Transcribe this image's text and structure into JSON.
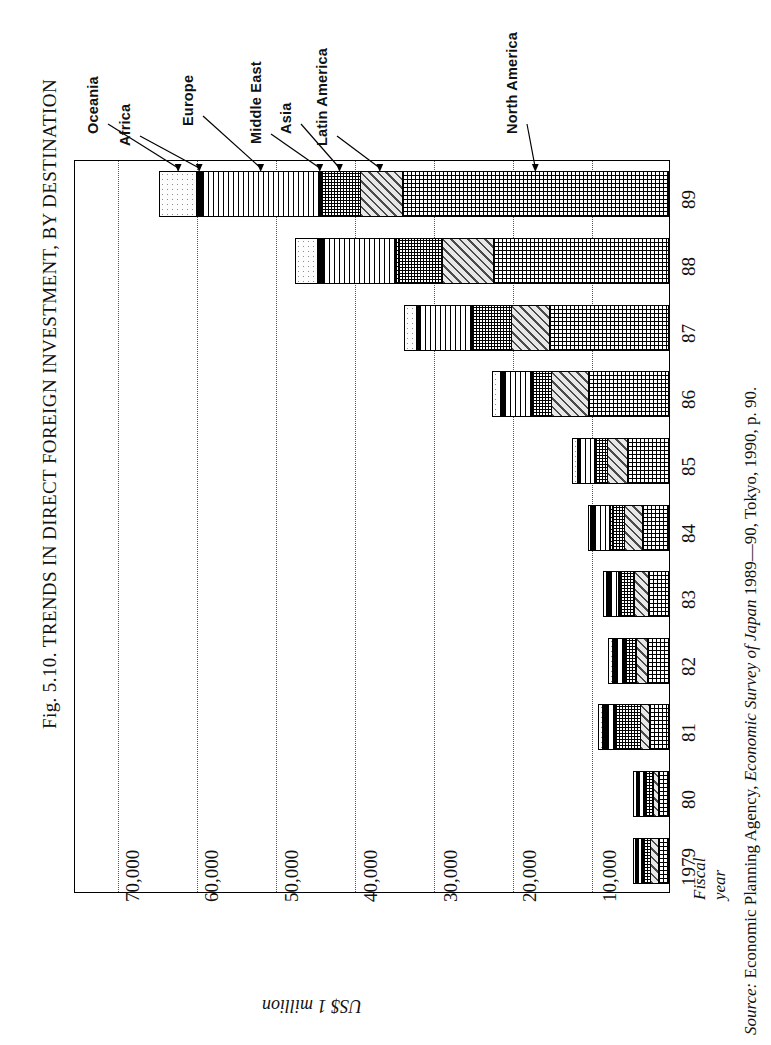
{
  "figure": {
    "title": "Fig. 5.10. TRENDS IN DIRECT FOREIGN INVESTMENT,  BY DESTINATION",
    "axis_unit": "US$ 1 million",
    "fiscal_label_line1": "Fiscal",
    "fiscal_label_line2": "year",
    "source_prefix": "Source:",
    "source_body_1": " Economic Planning Agency, ",
    "source_italic": "Economic Survey of Japan",
    "source_body_2": " 1989—90, Tokyo, 1990, p. 90."
  },
  "callouts": [
    {
      "label": "Oceania"
    },
    {
      "label": "Africa"
    },
    {
      "label": "Europe"
    },
    {
      "label": "Middle East"
    },
    {
      "label": "Asia"
    },
    {
      "label": "Latin America"
    },
    {
      "label": "North America"
    }
  ],
  "chart_data": {
    "type": "bar",
    "orientation": "horizontal-stacked",
    "title": "Fig. 5.10. TRENDS IN DIRECT FOREIGN INVESTMENT,  BY DESTINATION",
    "xlabel": "US$ 1 million",
    "ylabel": "Fiscal year",
    "grid": true,
    "legend_position": "callout-arrows-above-plot",
    "xlim": [
      0,
      75000
    ],
    "value_ticks": [
      "70,000",
      "60,000",
      "50,000",
      "40,000",
      "30,000",
      "20,000",
      "10,000"
    ],
    "value_tick_numbers": [
      70000,
      60000,
      50000,
      40000,
      30000,
      20000,
      10000
    ],
    "categories": [
      "1979",
      "80",
      "81",
      "82",
      "83",
      "84",
      "85",
      "86",
      "87",
      "88",
      "89"
    ],
    "series": [
      {
        "name": "North America",
        "pattern": "namerica",
        "values": [
          1438,
          1484,
          2522,
          2905,
          2701,
          3544,
          5495,
          10441,
          15357,
          22328,
          33902
        ]
      },
      {
        "name": "Latin America",
        "pattern": "latin",
        "values": [
          1207,
          588,
          1181,
          1503,
          1878,
          2290,
          2616,
          4737,
          4816,
          6428,
          5238
        ]
      },
      {
        "name": "Asia",
        "pattern": "asia",
        "values": [
          976,
          1186,
          3338,
          1384,
          1847,
          1628,
          1435,
          2327,
          4868,
          5569,
          4902
        ]
      },
      {
        "name": "Middle East",
        "pattern": "mideast",
        "values": [
          156,
          158,
          96,
          124,
          175,
          273,
          45,
          44,
          62,
          259,
          66
        ]
      },
      {
        "name": "Europe",
        "pattern": "europe",
        "values": [
          495,
          578,
          798,
          876,
          990,
          1937,
          1930,
          3469,
          6576,
          9116,
          14808
        ]
      },
      {
        "name": "Africa",
        "pattern": "africa",
        "values": [
          162,
          139,
          573,
          489,
          364,
          326,
          172,
          309,
          272,
          653,
          671
        ]
      },
      {
        "name": "Oceania",
        "pattern": "oceania",
        "values": [
          156,
          448,
          429,
          423,
          387,
          157,
          525,
          992,
          1413,
          2669,
          4618
        ]
      }
    ],
    "totals": [
      4590,
      4581,
      8937,
      7704,
      8342,
      10155,
      12218,
      22319,
      33364,
      47022,
      64205
    ]
  }
}
